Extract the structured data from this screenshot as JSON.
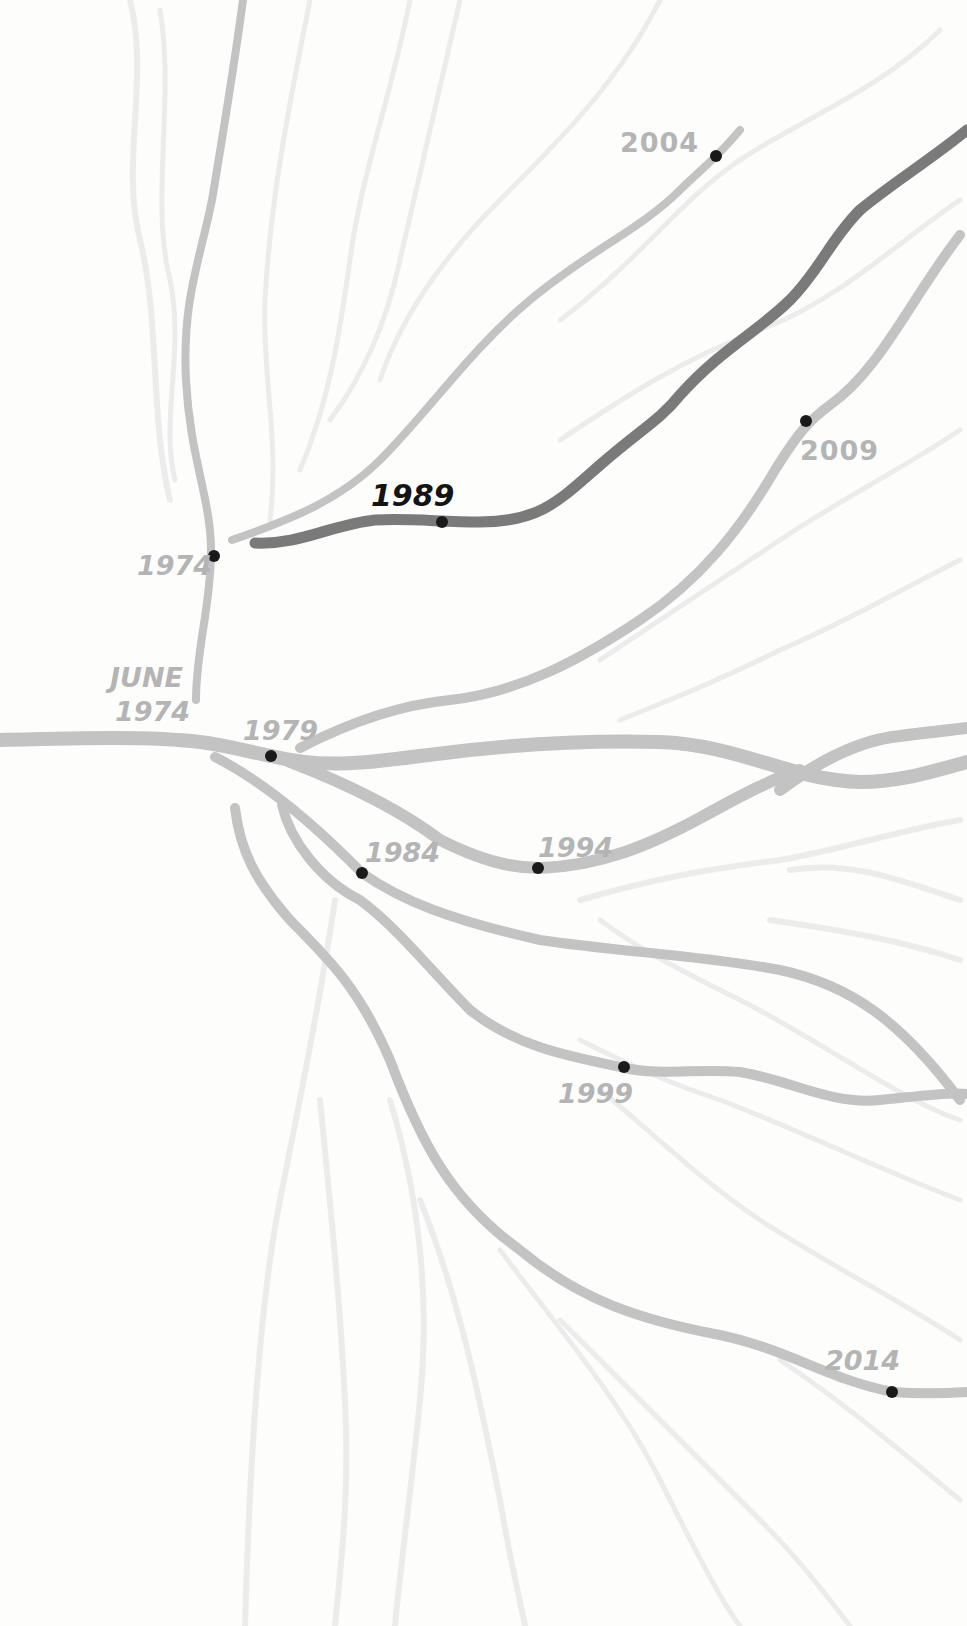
{
  "diagram": {
    "type": "branching-timeline",
    "colors": {
      "background": "#fdfdfc",
      "stream": "#c3c3c3",
      "faint_stream": "#ececec",
      "highlight_stream": "#7a7a7a",
      "node": "#1a1a1a",
      "label": "#b4b4b4",
      "highlight_label": "#141414"
    },
    "origin_label": {
      "line1": "JUNE",
      "line2": "1974"
    },
    "nodes": [
      {
        "id": "n1974",
        "label": "1974",
        "highlighted": false
      },
      {
        "id": "n1979",
        "label": "1979",
        "highlighted": false
      },
      {
        "id": "n1984",
        "label": "1984",
        "highlighted": false
      },
      {
        "id": "n1989",
        "label": "1989",
        "highlighted": true
      },
      {
        "id": "n1994",
        "label": "1994",
        "highlighted": false
      },
      {
        "id": "n1999",
        "label": "1999",
        "highlighted": false
      },
      {
        "id": "n2004",
        "label": "2004",
        "highlighted": false
      },
      {
        "id": "n2009",
        "label": "2009",
        "highlighted": false
      },
      {
        "id": "n2014",
        "label": "2014",
        "highlighted": false
      }
    ]
  }
}
